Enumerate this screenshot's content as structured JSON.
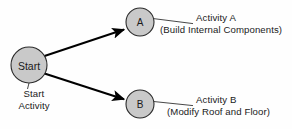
{
  "diagram": {
    "background_color": "#fefefe",
    "node_fill_color": "#c9c9c9",
    "node_stroke_color": "#2b2b2b",
    "arrow_color": "#000000",
    "nodes": [
      {
        "id": "start",
        "label": "Start",
        "cx": 29,
        "cy": 65,
        "r": 18
      },
      {
        "id": "a",
        "label": "A",
        "cx": 140,
        "cy": 22,
        "r": 14
      },
      {
        "id": "b",
        "label": "B",
        "cx": 140,
        "cy": 104,
        "r": 14
      }
    ],
    "edges": [
      {
        "id": "start-to-a",
        "from": "start",
        "to": "a"
      },
      {
        "id": "start-to-b",
        "from": "start",
        "to": "b"
      }
    ],
    "callouts": {
      "start": {
        "line1": "Start",
        "line2": "Activity"
      },
      "a": {
        "line1": "Activity A",
        "line2": "(Build Internal Components)"
      },
      "b": {
        "line1": "Activity B",
        "line2": "(Modify Roof and Floor)"
      }
    }
  }
}
